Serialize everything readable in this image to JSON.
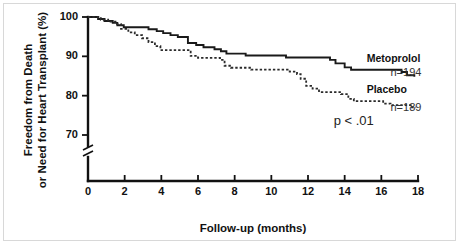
{
  "chart_data": {
    "type": "line",
    "title": "",
    "subtitle": "",
    "xlabel": "Follow-up (months)",
    "ylabel": "Freedom from Death or Need for Heart Transplant (%)",
    "ylabel_line1": "Freedom from Death",
    "ylabel_line2": "or Need for Heart Transplant (%)",
    "xlim": [
      0,
      18
    ],
    "ylim": [
      70,
      100
    ],
    "xticks": [
      0,
      2,
      4,
      6,
      8,
      10,
      12,
      14,
      16,
      18
    ],
    "xticklabels": [
      "0",
      "2",
      "4",
      "6",
      "8",
      "10",
      "12",
      "14",
      "16",
      "18"
    ],
    "yticks": [
      70,
      80,
      90,
      100
    ],
    "yticklabels": [
      "70",
      "80",
      "90",
      "100"
    ],
    "grid": false,
    "axis_break": true,
    "axis_break_note": "y-axis broken below 70",
    "legend_position": "inline-right",
    "annotations": [
      {
        "name": "p-value",
        "text": "p < .01",
        "x": 13.4,
        "y": 72.6
      }
    ],
    "series": [
      {
        "name": "Metoprolol",
        "label": "Metoprolol",
        "n_label": "n=194",
        "n": 194,
        "style": "solid",
        "color": "#1a1a1a",
        "label_x": 15.2,
        "label_y": 88.6,
        "n_label_x": 16.5,
        "n_label_y": 85.0,
        "points": [
          [
            0.0,
            100.0
          ],
          [
            0.55,
            100.0
          ],
          [
            0.55,
            99.5
          ],
          [
            0.9,
            99.5
          ],
          [
            0.9,
            99.0
          ],
          [
            1.35,
            99.0
          ],
          [
            1.35,
            98.5
          ],
          [
            1.6,
            98.5
          ],
          [
            1.6,
            97.9
          ],
          [
            1.95,
            97.9
          ],
          [
            1.95,
            97.4
          ],
          [
            3.3,
            97.4
          ],
          [
            3.3,
            96.9
          ],
          [
            3.75,
            96.9
          ],
          [
            3.75,
            96.4
          ],
          [
            4.1,
            96.4
          ],
          [
            4.1,
            95.9
          ],
          [
            4.5,
            95.9
          ],
          [
            4.5,
            95.4
          ],
          [
            4.9,
            95.4
          ],
          [
            4.9,
            94.9
          ],
          [
            5.45,
            94.9
          ],
          [
            5.45,
            93.4
          ],
          [
            5.9,
            93.4
          ],
          [
            5.9,
            92.9
          ],
          [
            6.3,
            92.9
          ],
          [
            6.3,
            92.3
          ],
          [
            6.9,
            92.3
          ],
          [
            6.9,
            91.8
          ],
          [
            7.25,
            91.8
          ],
          [
            7.25,
            91.3
          ],
          [
            7.55,
            91.3
          ],
          [
            7.55,
            90.7
          ],
          [
            8.6,
            90.7
          ],
          [
            8.6,
            90.2
          ],
          [
            10.8,
            90.2
          ],
          [
            10.8,
            89.7
          ],
          [
            13.2,
            89.7
          ],
          [
            13.2,
            89.1
          ],
          [
            13.5,
            89.1
          ],
          [
            13.5,
            88.2
          ],
          [
            14.0,
            88.2
          ],
          [
            14.0,
            87.2
          ],
          [
            14.35,
            87.2
          ],
          [
            14.35,
            86.6
          ],
          [
            17.1,
            86.6
          ],
          [
            17.1,
            86.0
          ],
          [
            17.4,
            86.0
          ],
          [
            17.4,
            85.2
          ],
          [
            17.8,
            85.2
          ],
          [
            17.8,
            84.8
          ]
        ]
      },
      {
        "name": "Placebo",
        "label": "Placebo",
        "n_label": "n=189",
        "n": 189,
        "style": "dashed",
        "color": "#2a2a2a",
        "label_x": 15.2,
        "label_y": 80.7,
        "n_label_x": 16.5,
        "n_label_y": 76.2,
        "points": [
          [
            0.0,
            100.0
          ],
          [
            0.7,
            100.0
          ],
          [
            0.7,
            99.3
          ],
          [
            1.1,
            99.3
          ],
          [
            1.1,
            98.8
          ],
          [
            1.5,
            98.8
          ],
          [
            1.5,
            98.2
          ],
          [
            1.8,
            98.2
          ],
          [
            1.8,
            97.0
          ],
          [
            2.2,
            97.0
          ],
          [
            2.2,
            96.1
          ],
          [
            2.55,
            96.1
          ],
          [
            2.55,
            95.4
          ],
          [
            2.95,
            95.4
          ],
          [
            2.95,
            94.6
          ],
          [
            3.3,
            94.6
          ],
          [
            3.3,
            93.6
          ],
          [
            3.65,
            93.6
          ],
          [
            3.65,
            92.6
          ],
          [
            3.95,
            92.6
          ],
          [
            3.95,
            91.6
          ],
          [
            5.6,
            91.6
          ],
          [
            5.6,
            90.1
          ],
          [
            6.0,
            90.1
          ],
          [
            6.0,
            89.6
          ],
          [
            7.2,
            89.6
          ],
          [
            7.2,
            89.1
          ],
          [
            7.45,
            89.1
          ],
          [
            7.45,
            87.6
          ],
          [
            7.8,
            87.6
          ],
          [
            7.8,
            87.1
          ],
          [
            8.9,
            87.1
          ],
          [
            8.9,
            86.6
          ],
          [
            11.0,
            86.6
          ],
          [
            11.0,
            86.1
          ],
          [
            11.4,
            86.1
          ],
          [
            11.4,
            85.5
          ],
          [
            11.6,
            85.5
          ],
          [
            11.6,
            84.3
          ],
          [
            11.9,
            84.3
          ],
          [
            11.9,
            82.5
          ],
          [
            12.25,
            82.5
          ],
          [
            12.25,
            81.8
          ],
          [
            12.6,
            81.8
          ],
          [
            12.6,
            80.9
          ],
          [
            13.8,
            80.9
          ],
          [
            13.8,
            80.4
          ],
          [
            14.2,
            80.4
          ],
          [
            14.2,
            79.2
          ],
          [
            14.5,
            79.2
          ],
          [
            14.5,
            78.6
          ],
          [
            16.1,
            78.6
          ],
          [
            16.1,
            78.0
          ],
          [
            16.5,
            78.0
          ],
          [
            16.5,
            77.6
          ],
          [
            17.6,
            77.6
          ],
          [
            17.6,
            77.0
          ],
          [
            17.9,
            77.0
          ]
        ]
      }
    ]
  },
  "figure": {
    "xlabel": "Follow-up (months)",
    "ylabel_line1": "Freedom from Death",
    "ylabel_line2": "or Need for Heart Transplant (%)",
    "p_value": "p < .01",
    "metoprolol_label": "Metoprolol",
    "metoprolol_n": "n=194",
    "placebo_label": "Placebo",
    "placebo_n": "n=189"
  }
}
